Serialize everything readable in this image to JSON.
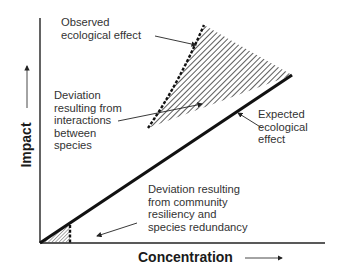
{
  "diagram": {
    "type": "conceptual-impact-concentration",
    "axes": {
      "x_label": "Concentration",
      "y_label": "Impact"
    },
    "annotations": {
      "observed": {
        "line1": "Observed",
        "line2": "ecological effect"
      },
      "interactions": {
        "line1": "Deviation",
        "line2": "resulting from",
        "line3": "interactions",
        "line4": "between",
        "line5": "species"
      },
      "expected": {
        "line1": "Expected",
        "line2": "ecological",
        "line3": "effect"
      },
      "resiliency": {
        "line1": "Deviation resulting",
        "line2": "from community",
        "line3": "resiliency and",
        "line4": "species redundancy"
      }
    },
    "colors": {
      "line": "#111111",
      "hatch": "#333333",
      "text": "#333333",
      "background": "#ffffff"
    }
  }
}
